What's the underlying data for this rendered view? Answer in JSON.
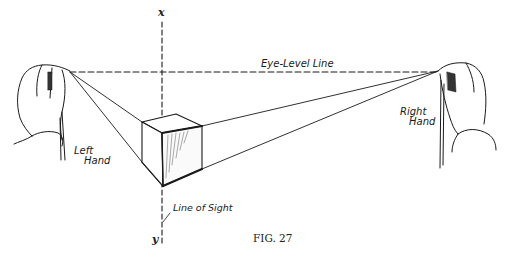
{
  "figure": {
    "caption": "Fig. 27",
    "caption_display": "FIG. 27",
    "labels": {
      "eye_level_line": "Eye-Level Line",
      "left_hand_line1": "Left",
      "left_hand_line2": "Hand",
      "right_hand_line1": "Right",
      "right_hand_line2": "Hand",
      "line_of_sight": "Line of Sight",
      "axis_top": "x",
      "axis_bottom": "y"
    },
    "colors": {
      "ink": "#1a1a1a",
      "background": "#ffffff"
    }
  }
}
